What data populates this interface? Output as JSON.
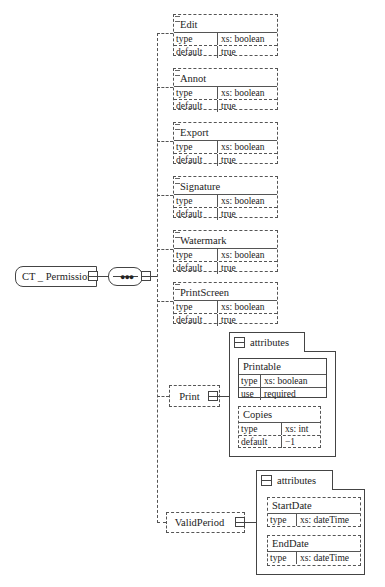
{
  "root": {
    "name": "CT _ Permission",
    "compositor": "sequence"
  },
  "elements": [
    {
      "name": "Edit",
      "rows": [
        {
          "key": "type",
          "value": "xs: boolean"
        },
        {
          "key": "default",
          "value": "true"
        }
      ]
    },
    {
      "name": "Annot",
      "rows": [
        {
          "key": "type",
          "value": "xs: boolean"
        },
        {
          "key": "default",
          "value": "true"
        }
      ]
    },
    {
      "name": "Export",
      "rows": [
        {
          "key": "type",
          "value": "xs: boolean"
        },
        {
          "key": "default",
          "value": "true"
        }
      ]
    },
    {
      "name": "Signature",
      "rows": [
        {
          "key": "type",
          "value": "xs: boolean"
        },
        {
          "key": "default",
          "value": "true"
        }
      ]
    },
    {
      "name": "Watermark",
      "rows": [
        {
          "key": "type",
          "value": "xs: boolean"
        },
        {
          "key": "default",
          "value": "true"
        }
      ]
    },
    {
      "name": "PrintScreen",
      "rows": [
        {
          "key": "type",
          "value": "xs: boolean"
        },
        {
          "key": "default",
          "value": "true"
        }
      ]
    }
  ],
  "print": {
    "name": "Print",
    "attributes_label": "attributes",
    "attributes": [
      {
        "name": "Printable",
        "rows": [
          {
            "key": "type",
            "value": "xs:  boolean"
          },
          {
            "key": "use",
            "value": "required"
          }
        ]
      },
      {
        "name": "Copies",
        "rows": [
          {
            "key": "type",
            "value": "xs: int"
          },
          {
            "key": "default",
            "value": "−1"
          }
        ]
      }
    ]
  },
  "valid_period": {
    "name": "ValidPeriod",
    "attributes_label": "attributes",
    "attributes": [
      {
        "name": "StartDate",
        "rows": [
          {
            "key": "type",
            "value": "xs: dateTime"
          }
        ]
      },
      {
        "name": "EndDate",
        "rows": [
          {
            "key": "type",
            "value": "xs: dateTime"
          }
        ]
      }
    ]
  }
}
